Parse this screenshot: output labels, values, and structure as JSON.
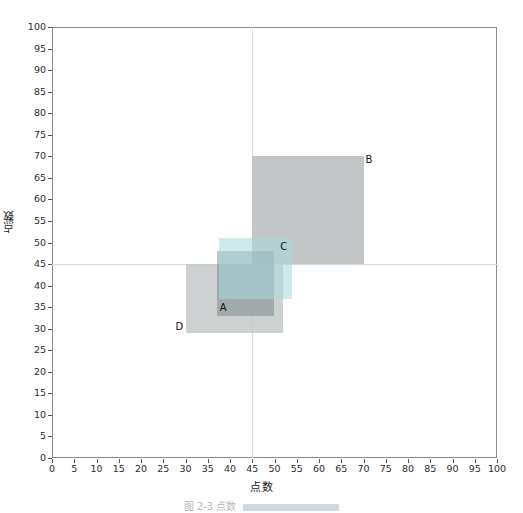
{
  "chart_data": {
    "type": "scatter",
    "title": "",
    "xlabel": "点数",
    "ylabel": "点数",
    "xlim": [
      0,
      100
    ],
    "ylim": [
      0,
      100
    ],
    "xticks": [
      0,
      5,
      10,
      15,
      20,
      25,
      30,
      35,
      40,
      45,
      50,
      55,
      60,
      65,
      70,
      75,
      80,
      85,
      90,
      95,
      100
    ],
    "yticks": [
      0,
      5,
      10,
      15,
      20,
      25,
      30,
      35,
      40,
      45,
      50,
      55,
      60,
      65,
      70,
      75,
      80,
      85,
      90,
      95,
      100
    ],
    "grid": false,
    "legend": "none",
    "crosshair": {
      "x": 45,
      "y": 45,
      "color": "#d9d9d9"
    },
    "rectangles": [
      {
        "name": "B",
        "x0": 45,
        "y0": 45,
        "x1": 70,
        "y1": 70,
        "fill": "#b9bcbc",
        "opacity": 0.85,
        "label": "B",
        "label_pos": "top-right"
      },
      {
        "name": "D",
        "x0": 30,
        "y0": 29,
        "x1": 52,
        "y1": 45,
        "fill": "#c4c9c9",
        "opacity": 0.85,
        "label": "D",
        "label_pos": "bottom-left"
      },
      {
        "name": "A",
        "x0": 37,
        "y0": 33,
        "x1": 50,
        "y1": 48,
        "fill": "#7f8c8e",
        "opacity": 0.55,
        "label": "A",
        "label_pos": "bottom-left-inside"
      },
      {
        "name": "C",
        "x0": 37.5,
        "y0": 37,
        "x1": 54,
        "y1": 51,
        "fill": "#a8d8de",
        "opacity": 0.55,
        "label": "C",
        "label_pos": "top-right-inside"
      }
    ]
  },
  "caption": {
    "text": "图 2-3  点数",
    "bar_color": "#cfd8de"
  },
  "axis": {
    "frame_color": "#8a8a8a",
    "tick_color": "#555555"
  }
}
